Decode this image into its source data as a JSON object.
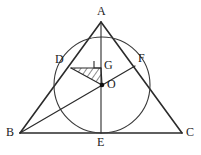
{
  "figure": {
    "canvas": {
      "width": 201,
      "height": 155
    },
    "colors": {
      "stroke": "#2b2b2b",
      "circle_stroke": "#3a3a3a",
      "hatch": "#2b2b2b",
      "background": "#ffffff",
      "label": "#1a1a1a",
      "point_fill": "#111111"
    },
    "points": [
      {
        "id": "A",
        "label": "A",
        "x": 101,
        "y": 22,
        "label_x": 97,
        "label_y": 5
      },
      {
        "id": "B",
        "label": "B",
        "x": 20,
        "y": 133,
        "label_x": 6,
        "label_y": 126
      },
      {
        "id": "C",
        "label": "C",
        "x": 182,
        "y": 133,
        "label_x": 186,
        "label_y": 126
      },
      {
        "id": "D",
        "label": "D",
        "x": 71,
        "y": 68,
        "label_x": 55,
        "label_y": 53
      },
      {
        "id": "E",
        "label": "E",
        "x": 101,
        "y": 133,
        "label_x": 97,
        "label_y": 136
      },
      {
        "id": "F",
        "label": "F",
        "x": 135,
        "y": 66,
        "label_x": 138,
        "label_y": 52
      },
      {
        "id": "G",
        "label": "G",
        "x": 101,
        "y": 68,
        "label_x": 104,
        "label_y": 59
      },
      {
        "id": "O",
        "label": "O",
        "x": 102,
        "y": 85,
        "label_x": 107,
        "label_y": 78
      }
    ],
    "circle": {
      "cx": 102,
      "cy": 85,
      "r": 48
    },
    "segments": [
      {
        "name": "side-ab",
        "from": "A",
        "to": "B"
      },
      {
        "name": "side-ac",
        "from": "A",
        "to": "C"
      },
      {
        "name": "side-bc",
        "from": "B",
        "to": "C"
      },
      {
        "name": "altitude-ae",
        "from": "A",
        "to": "E"
      },
      {
        "name": "cevian-bf",
        "from": "B",
        "to": "F"
      },
      {
        "name": "segment-dg",
        "from": "D",
        "to": "G"
      },
      {
        "name": "segment-go",
        "from": "G",
        "to": "O"
      },
      {
        "name": "segment-do",
        "from": "D",
        "to": "O"
      }
    ],
    "shaded_region": {
      "name": "triangle-dgo",
      "vertices": [
        "D",
        "G",
        "O"
      ],
      "fill": "hatch-diagonal"
    },
    "right_angle_marker": {
      "at": "G",
      "size": 7
    },
    "marked_points": [
      "O"
    ]
  }
}
